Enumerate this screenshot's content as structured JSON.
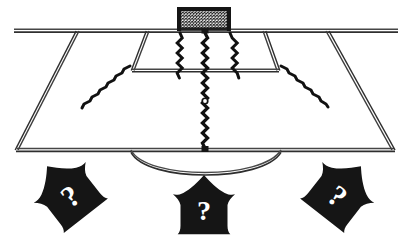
{
  "figure": {
    "background_color": "#ffffff",
    "ink_color": "#151515",
    "line_color": "#3a3a3a",
    "highlight_color": "#ffffff",
    "width": 408,
    "height": 239
  },
  "pitch": {
    "name": "penalty-area-perspective",
    "goal_line": {
      "x1": 14,
      "y1": 30.5,
      "x2": 398,
      "y2": 30.5
    },
    "byline": {
      "x1": 16,
      "y1": 150,
      "x2": 394,
      "y2": 150
    },
    "left_sideline": {
      "x1": 78,
      "y1": 31,
      "x2": 17,
      "y2": 150
    },
    "right_sideline": {
      "x1": 327,
      "y1": 31,
      "x2": 393,
      "y2": 150
    },
    "penalty_box": {
      "top_left_x": 148,
      "top_right_x": 264,
      "bottom_left_x": 133,
      "bottom_right_x": 278,
      "top_y": 31,
      "bottom_y": 71
    },
    "center_arc": {
      "start_x": 131,
      "end_x": 281,
      "apex_y": 176,
      "baseline_y": 150
    }
  },
  "goal": {
    "name": "goal-with-net",
    "x": 177,
    "y": 7,
    "width": 54,
    "height": 24,
    "net_mesh": true,
    "post_color": "#151515",
    "net_density": 15
  },
  "markers": {
    "penalty_spot": {
      "x": 205,
      "y": 101,
      "r": 2.6,
      "label": "penalty-spot"
    },
    "goal_spot": {
      "x": 205,
      "y": 31,
      "label": "goal-center-spot"
    }
  },
  "run_lines": [
    {
      "name": "center-run-line",
      "style": "beaded-vertical",
      "x1": 205,
      "y1": 31,
      "x2": 205,
      "y2": 152,
      "amplitude": 2.4,
      "period": 7
    },
    {
      "name": "left-inner-run-line",
      "style": "beaded-vertical",
      "x1": 179,
      "y1": 33,
      "x2": 172,
      "y2": 74,
      "amplitude": 2.2,
      "period": 6.5
    },
    {
      "name": "right-inner-run-line",
      "style": "beaded-vertical",
      "x1": 231,
      "y1": 33,
      "x2": 238,
      "y2": 74,
      "amplitude": 2.2,
      "period": 6.5
    },
    {
      "name": "left-outer-run-line",
      "style": "beaded-diagonal",
      "x1": 130,
      "y1": 66,
      "x2": 76,
      "y2": 110,
      "amplitude": 2.2,
      "period": 6.5
    },
    {
      "name": "right-outer-run-line",
      "style": "beaded-diagonal",
      "x1": 281,
      "y1": 66,
      "x2": 328,
      "y2": 108,
      "amplitude": 2.2,
      "period": 6.5
    }
  ],
  "arrows": [
    {
      "name": "arrow-left-question",
      "label": "?",
      "direction": "up-right",
      "rotation": -38,
      "cx": 68,
      "cy": 193,
      "scale": 1.0,
      "fill": "#151515",
      "label_color": "#ffffff"
    },
    {
      "name": "arrow-center-question",
      "label": "?",
      "direction": "up",
      "rotation": 0,
      "cx": 204,
      "cy": 207,
      "scale": 0.94,
      "fill": "#151515",
      "label_color": "#ffffff"
    },
    {
      "name": "arrow-right-question",
      "label": "?",
      "direction": "up-left",
      "rotation": 38,
      "cx": 340,
      "cy": 193,
      "scale": 1.0,
      "fill": "#151515",
      "label_color": "#ffffff"
    }
  ]
}
